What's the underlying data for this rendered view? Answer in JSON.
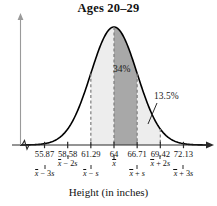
{
  "chart_data": {
    "type": "area",
    "title": "Ages 20–29",
    "xlabel": "Height (in inches)",
    "ylabel": "",
    "grid": false,
    "legend": "none",
    "distribution": "normal",
    "mean": 64,
    "std": 2.71,
    "xlim": [
      53.0,
      75.0
    ],
    "tick_values": [
      "55.87",
      "58.58",
      "61.29",
      "64",
      "66.71",
      "69.42",
      "72.13"
    ],
    "tick_numeric": [
      55.87,
      58.58,
      61.29,
      64,
      66.71,
      69.42,
      72.13
    ],
    "tick_notation_rows": [
      {
        "row": "b",
        "value": 55.87,
        "mean_symbol": "x",
        "text": " − 3",
        "sd_symbol": "s"
      },
      {
        "row": "a",
        "value": 58.58,
        "mean_symbol": "x",
        "text": " − 2",
        "sd_symbol": "s"
      },
      {
        "row": "b",
        "value": 61.29,
        "mean_symbol": "x",
        "text": " − ",
        "sd_symbol": "s"
      },
      {
        "row": "a",
        "value": 64,
        "mean_symbol": "x",
        "text": "",
        "sd_symbol": ""
      },
      {
        "row": "b",
        "value": 66.71,
        "mean_symbol": "x",
        "text": " + ",
        "sd_symbol": "s"
      },
      {
        "row": "a",
        "value": 69.42,
        "mean_symbol": "x",
        "text": " + 2",
        "sd_symbol": "s"
      },
      {
        "row": "b",
        "value": 72.13,
        "mean_symbol": "x",
        "text": " + 3",
        "sd_symbol": "s"
      }
    ],
    "annotations": [
      {
        "label": "34%",
        "region": [
          64,
          66.71
        ],
        "shade": "dark"
      },
      {
        "label": "13.5%",
        "region": [
          66.71,
          69.42
        ],
        "shade": "light"
      }
    ],
    "shaded_regions": [
      {
        "from": 61.29,
        "to": 64,
        "color": "#ededed"
      },
      {
        "from": 64,
        "to": 66.71,
        "color": "#a8a8a8"
      },
      {
        "from": 66.71,
        "to": 69.42,
        "color": "#ededed"
      }
    ],
    "dashed_gridline_values": [
      61.29,
      64,
      66.71,
      69.42
    ],
    "axis_break": true,
    "colors": {
      "curve": "#000000",
      "shade_dark": "#a8a8a8",
      "shade_light": "#ededed",
      "axis": "#2a2a2a",
      "text": "#121212"
    }
  },
  "labels": {
    "pct_34": "34%",
    "pct_135": "13.5%"
  }
}
